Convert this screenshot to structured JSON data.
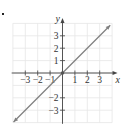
{
  "chart_data": {
    "type": "line",
    "title": "",
    "equation": "y = x",
    "xlabel": "x",
    "ylabel": "y",
    "xlim": [
      -4,
      4
    ],
    "ylim": [
      -4,
      4
    ],
    "grid": true,
    "x_ticks": [
      -3,
      -2,
      -1,
      1,
      2,
      3
    ],
    "y_ticks": [
      -3,
      -2,
      1,
      2,
      3
    ],
    "x_tick_labels": [
      "−3",
      "−2",
      "−1",
      "1",
      "2",
      "3"
    ],
    "y_tick_labels": [
      "−3",
      "−2",
      "1",
      "2",
      "3"
    ],
    "series": [
      {
        "name": "y = x",
        "x": [
          -4,
          -3,
          -2,
          -1,
          0,
          1,
          2,
          3,
          3.9
        ],
        "y": [
          -4,
          -3,
          -2,
          -1,
          0,
          1,
          2,
          3,
          3.9
        ],
        "arrows": "both",
        "marked_point": [
          0,
          0
        ]
      }
    ],
    "colors": {
      "line": "#808080",
      "axis": "#444444",
      "grid": "#e6e6e6",
      "text": "#333333"
    }
  }
}
